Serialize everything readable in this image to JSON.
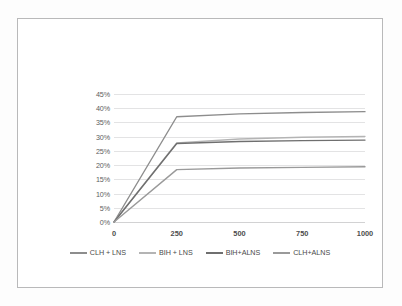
{
  "chart_data": {
    "type": "line",
    "title": "",
    "subtitle": "",
    "xlabel": "",
    "ylabel": "",
    "x": [
      0,
      250,
      500,
      750,
      1000
    ],
    "xticks": [
      "0",
      "250",
      "500",
      "750",
      "1000"
    ],
    "xlim": [
      0,
      1000
    ],
    "yticks": [
      "0%",
      "5%",
      "10%",
      "15%",
      "20%",
      "25%",
      "30%",
      "35%",
      "40%",
      "45%"
    ],
    "ytick_values": [
      0,
      5,
      10,
      15,
      20,
      25,
      30,
      35,
      40,
      45
    ],
    "ylim": [
      0,
      45
    ],
    "grid": "horizontal",
    "legend_position": "bottom",
    "series": [
      {
        "name": "CLH + LNS",
        "color": "#8d8d8d",
        "values": [
          0,
          37.0,
          38.0,
          38.5,
          38.8
        ]
      },
      {
        "name": "BIH + LNS",
        "color": "#b4b4b4",
        "values": [
          0,
          27.8,
          29.2,
          29.8,
          30.1
        ]
      },
      {
        "name": "BIH+ALNS",
        "color": "#6f6f6f",
        "values": [
          0,
          27.6,
          28.3,
          28.6,
          28.8
        ]
      },
      {
        "name": "CLH+ALNS",
        "color": "#9a9a9a",
        "values": [
          0,
          18.4,
          19.0,
          19.2,
          19.4
        ]
      }
    ]
  },
  "style": {
    "grid_color": "#e3e3e4",
    "axis_color": "#d2d2d3",
    "tick_label_color": "#5d5d5d",
    "frame_border_color": "#b9b9ba",
    "page_background": "#fdfdfd",
    "chart_background": "#ffffff"
  }
}
